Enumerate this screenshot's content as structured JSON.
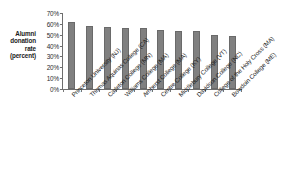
{
  "chart_data": {
    "type": "bar",
    "title": "",
    "xlabel": "",
    "ylabel": "Alumni donation rate (percent)",
    "ylim": [
      0,
      70
    ],
    "ytick_labels": [
      "70%",
      "60%",
      "50%",
      "40%",
      "30%",
      "20%",
      "10%",
      "0%"
    ],
    "ytick_values": [
      70,
      60,
      50,
      40,
      30,
      20,
      10,
      0
    ],
    "grid": false,
    "legend": false,
    "bar_color": "#808080",
    "axis_color": "#6e6e6e",
    "categories": [
      "Princeton University (NJ)",
      "Thomas Aquinas College (CA)",
      "Carleton College (MN)",
      "Williams College (MA)",
      "Amherst College (MA)",
      "Centre College (KY)",
      "Middlebury College (VT)",
      "Davidson College (NC)",
      "College of the Holy Cross (MA)",
      "Bowdoin College (ME)"
    ],
    "values": [
      62,
      58,
      57,
      56,
      56,
      54,
      53,
      53,
      50,
      49
    ]
  },
  "y_axis": {
    "title_lines": [
      "Alumni",
      "donation",
      "rate",
      "(percent)"
    ]
  },
  "caption": {
    "residue_text": ""
  }
}
